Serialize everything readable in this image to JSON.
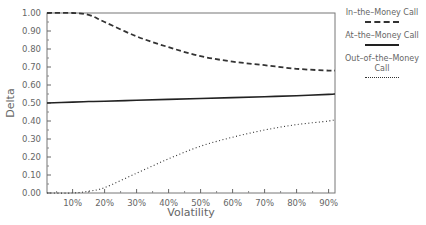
{
  "chart_data": {
    "type": "line",
    "title": "",
    "xlabel": "Volatility",
    "ylabel": "Delta",
    "xlim": [
      2,
      92
    ],
    "ylim": [
      0,
      1
    ],
    "x_ticks": [
      "10%",
      "20%",
      "30%",
      "40%",
      "50%",
      "60%",
      "70%",
      "80%",
      "90%"
    ],
    "y_ticks": [
      "0.00",
      "0.10",
      "0.20",
      "0.30",
      "0.40",
      "0.50",
      "0.60",
      "0.70",
      "0.80",
      "0.90",
      "1.00"
    ],
    "grid": false,
    "legend_position": "right",
    "x": [
      2,
      10,
      15,
      20,
      30,
      40,
      50,
      60,
      70,
      80,
      90,
      92
    ],
    "series": [
      {
        "name": "In-the-Money Call",
        "style": "dashed",
        "values": [
          1.0,
          1.0,
          0.99,
          0.95,
          0.87,
          0.81,
          0.76,
          0.73,
          0.71,
          0.69,
          0.68,
          0.68
        ]
      },
      {
        "name": "At-the-Money Call",
        "style": "solid",
        "values": [
          0.5,
          0.505,
          0.508,
          0.51,
          0.515,
          0.52,
          0.525,
          0.53,
          0.535,
          0.54,
          0.548,
          0.55
        ]
      },
      {
        "name": "Out-of-the-Money Call",
        "style": "dotted",
        "values": [
          0.0,
          0.0,
          0.01,
          0.03,
          0.11,
          0.19,
          0.26,
          0.31,
          0.35,
          0.38,
          0.4,
          0.41
        ]
      }
    ]
  },
  "legend": {
    "items": [
      {
        "label": "In–the–Money Call"
      },
      {
        "label": "At–the–Money Call"
      },
      {
        "label": "Out–of–the–Money Call"
      }
    ]
  }
}
